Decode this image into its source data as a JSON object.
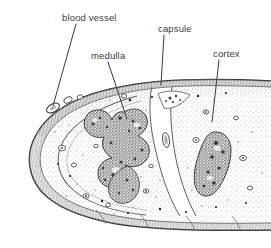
{
  "figure": {
    "background_color": "#ffffff",
    "ink_color": "#3b3b3b",
    "labels": [
      {
        "id": "blood-vessel",
        "text": "blood vessel",
        "x": 62,
        "y": 13,
        "leader": {
          "x1": 76,
          "y1": 24,
          "x2": 53,
          "y2": 106
        }
      },
      {
        "id": "medulla",
        "text": "medulla",
        "x": 91,
        "y": 51,
        "leader": {
          "x1": 108,
          "y1": 62,
          "x2": 127,
          "y2": 119
        }
      },
      {
        "id": "capsule",
        "text": "capsule",
        "x": 158,
        "y": 24,
        "leader": {
          "x1": 164,
          "y1": 35,
          "x2": 161,
          "y2": 85
        }
      },
      {
        "id": "cortex",
        "text": "cortex",
        "x": 213,
        "y": 49,
        "leader": {
          "x1": 219,
          "y1": 60,
          "x2": 212,
          "y2": 122
        }
      }
    ]
  }
}
